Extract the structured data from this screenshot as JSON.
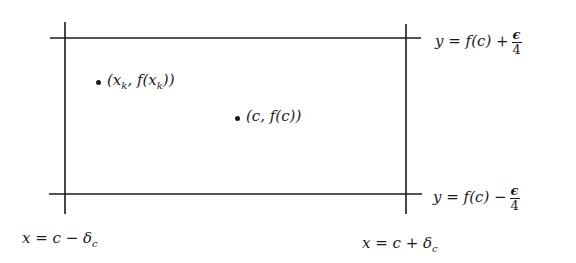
{
  "diagram": {
    "type": "epsilon-delta rectangle",
    "lines": {
      "top": {
        "label_pre": "y = f(c) +",
        "frac_num": "ϵ",
        "frac_den": "4"
      },
      "bottom": {
        "label_pre": "y = f(c) −",
        "frac_num": "ϵ",
        "frac_den": "4"
      },
      "left": {
        "label_pre": "x = c − δ",
        "sub": "c"
      },
      "right": {
        "label_pre": "x = c + δ",
        "sub": "c"
      }
    },
    "points": [
      {
        "label_a": "(x",
        "sub1": "k",
        "label_b": ", f(x",
        "sub2": "k",
        "label_c": "))"
      },
      {
        "label": "(c, f(c))"
      }
    ],
    "colors": {
      "ink": "#1a1a1a",
      "background": "#ffffff"
    }
  }
}
